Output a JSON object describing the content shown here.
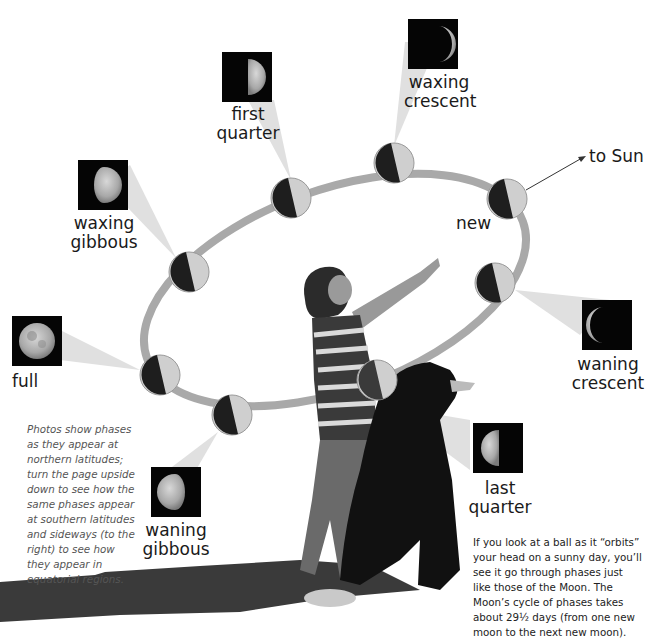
{
  "diagram": {
    "title_fragment": "upon going of the sky, the Moon",
    "sun_label": "to Sun",
    "new_label": "new",
    "phases": [
      {
        "id": "waxing-crescent",
        "line1": "waxing",
        "line2": "crescent"
      },
      {
        "id": "first-quarter",
        "line1": "first",
        "line2": "quarter"
      },
      {
        "id": "waxing-gibbous",
        "line1": "waxing",
        "line2": "gibbous"
      },
      {
        "id": "full",
        "line1": "full",
        "line2": ""
      },
      {
        "id": "waning-gibbous",
        "line1": "waning",
        "line2": "gibbous"
      },
      {
        "id": "last-quarter",
        "line1": "last",
        "line2": "quarter"
      },
      {
        "id": "waning-crescent",
        "line1": "waning",
        "line2": "crescent"
      }
    ],
    "caption_photos": "Photos show phases as they appear at northern latitudes; turn the page upside down to see how the same phases appear at southern latitudes and sideways (to the right) to see how they appear in equatorial regions.",
    "caption_ball": "If you look at a ball as it “orbits” your head on a sunny day, you’ll see it go through phases just like those of the Moon. The Moon’s cycle of phases takes about 29½ days (from one new moon to the next new moon).",
    "colors": {
      "orbit": "#a9a9a9",
      "ball_dark": "#1e1e1e",
      "ball_light": "#cfcfcf",
      "beam": "#dedede",
      "photo_bg": "#050505"
    }
  }
}
